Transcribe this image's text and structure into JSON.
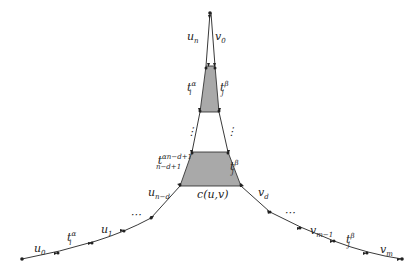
{
  "diagram": {
    "colors": {
      "line": "#222222",
      "fill": "#a9a9a9",
      "background": "#ffffff"
    },
    "labels": {
      "u_n": "u",
      "u_n_sub": "n",
      "v_0": "v",
      "v_0_sub": "0",
      "t_upper_left": "t",
      "t_upper_left_sub": "i",
      "t_upper_left_subsub": "n",
      "t_upper_left_sup": "α",
      "t_upper_left_supsub": "n",
      "t_upper_right": "t",
      "t_upper_right_sub": "j",
      "t_upper_right_subsub": "1",
      "t_upper_right_sup": "β",
      "t_upper_right_supsub": "1",
      "dots_left": "⋮",
      "dots_right": "⋮",
      "t_lower_left": "t",
      "t_lower_left_sub": "n−d+1",
      "t_lower_left_sup": "α",
      "t_lower_left_supsub": "n−d+1",
      "t_lower_right": "t",
      "t_lower_right_sub": "j",
      "t_lower_right_subsub": "d",
      "t_lower_right_sup": "β",
      "t_lower_right_supsub": "d",
      "c_uv": "c(u,v)",
      "u_nd": "u",
      "u_nd_sub": "n−d",
      "v_d": "v",
      "v_d_sub": "d",
      "dots_lower_left": "⋯",
      "dots_lower_right": "⋯",
      "u_1": "u",
      "u_1_sub": "1",
      "t_i1": "t",
      "t_i1_sub": "i",
      "t_i1_subsub": "1",
      "t_i1_sup": "α",
      "t_i1_supsub": "1",
      "u_0": "u",
      "u_0_sub": "0",
      "v_m1": "v",
      "v_m1_sub": "m−1",
      "t_jm": "t",
      "t_jm_sub": "j",
      "t_jm_subsub": "m",
      "t_jm_sup": "β",
      "t_jm_supsub": "m",
      "v_m": "v",
      "v_m_sub": "m"
    }
  }
}
